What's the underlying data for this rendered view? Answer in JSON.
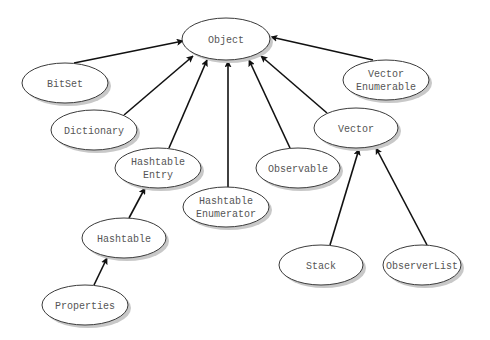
{
  "diagram": {
    "type": "class-hierarchy",
    "colors": {
      "background": "#ffffff",
      "node_fill": "#ffffff",
      "node_stroke": "#3a3a3a",
      "node_shadow": "#c8c8c8",
      "label": "#555555",
      "edge": "#111111"
    },
    "nodes": [
      {
        "id": "object",
        "lines": [
          "Object"
        ],
        "cx": 226,
        "cy": 39,
        "rx": 44,
        "ry": 21
      },
      {
        "id": "bitset",
        "lines": [
          "BitSet"
        ],
        "cx": 65,
        "cy": 83,
        "rx": 43,
        "ry": 20
      },
      {
        "id": "vector-enumerable",
        "lines": [
          "Vector",
          "Enumerable"
        ],
        "cx": 386,
        "cy": 80,
        "rx": 43,
        "ry": 20
      },
      {
        "id": "dictionary",
        "lines": [
          "Dictionary"
        ],
        "cx": 94,
        "cy": 130,
        "rx": 43,
        "ry": 20
      },
      {
        "id": "vector",
        "lines": [
          "Vector"
        ],
        "cx": 356,
        "cy": 128,
        "rx": 42,
        "ry": 20
      },
      {
        "id": "hashtable-entry",
        "lines": [
          "Hashtable",
          "Entry"
        ],
        "cx": 158,
        "cy": 168,
        "rx": 43,
        "ry": 20
      },
      {
        "id": "observable",
        "lines": [
          "Observable"
        ],
        "cx": 298,
        "cy": 168,
        "rx": 42,
        "ry": 20
      },
      {
        "id": "hashtable-enumerator",
        "lines": [
          "Hashtable",
          "Enumerator"
        ],
        "cx": 226,
        "cy": 207,
        "rx": 43,
        "ry": 20
      },
      {
        "id": "hashtable",
        "lines": [
          "Hashtable"
        ],
        "cx": 124,
        "cy": 238,
        "rx": 42,
        "ry": 20
      },
      {
        "id": "stack",
        "lines": [
          "Stack"
        ],
        "cx": 321,
        "cy": 265,
        "rx": 42,
        "ry": 20
      },
      {
        "id": "observerlist",
        "lines": [
          "ObserverList"
        ],
        "cx": 422,
        "cy": 265,
        "rx": 39,
        "ry": 20
      },
      {
        "id": "properties",
        "lines": [
          "Properties"
        ],
        "cx": 85,
        "cy": 305,
        "rx": 43,
        "ry": 20
      }
    ],
    "edges": [
      {
        "from": "bitset",
        "to": "object",
        "x1": 74,
        "y1": 63,
        "x2": 183,
        "y2": 41
      },
      {
        "from": "dictionary",
        "to": "object",
        "x1": 124,
        "y1": 115,
        "x2": 193,
        "y2": 56
      },
      {
        "from": "hashtable-entry",
        "to": "object",
        "x1": 169,
        "y1": 148,
        "x2": 207,
        "y2": 60
      },
      {
        "from": "hashtable-enumerator",
        "to": "object",
        "x1": 228,
        "y1": 187,
        "x2": 228,
        "y2": 61
      },
      {
        "from": "observable",
        "to": "object",
        "x1": 290,
        "y1": 148,
        "x2": 249,
        "y2": 60
      },
      {
        "from": "vector",
        "to": "object",
        "x1": 327,
        "y1": 113,
        "x2": 261,
        "y2": 56
      },
      {
        "from": "vector-enumerable",
        "to": "object",
        "x1": 373,
        "y1": 60,
        "x2": 271,
        "y2": 37
      },
      {
        "from": "hashtable",
        "to": "hashtable-entry",
        "x1": 129,
        "y1": 218,
        "x2": 145,
        "y2": 188
      },
      {
        "from": "properties",
        "to": "hashtable",
        "x1": 94,
        "y1": 285,
        "x2": 107,
        "y2": 258
      },
      {
        "from": "stack",
        "to": "vector",
        "x1": 330,
        "y1": 245,
        "x2": 359,
        "y2": 149
      },
      {
        "from": "observerlist",
        "to": "vector",
        "x1": 427,
        "y1": 245,
        "x2": 376,
        "y2": 148
      }
    ]
  }
}
